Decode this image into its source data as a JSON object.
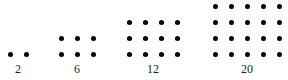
{
  "figures": [
    {
      "label": "2",
      "cols": 2,
      "rows": 1,
      "x0": 10,
      "label_x": 18
    },
    {
      "label": "6",
      "cols": 3,
      "rows": 2,
      "x0": 61,
      "label_x": 77
    },
    {
      "label": "12",
      "cols": 4,
      "rows": 3,
      "x0": 129,
      "label_x": 153
    },
    {
      "label": "20",
      "cols": 5,
      "rows": 4,
      "x0": 215,
      "label_x": 247
    }
  ],
  "spacing": 16,
  "baseline_y": 54,
  "dot_color": "#000000"
}
